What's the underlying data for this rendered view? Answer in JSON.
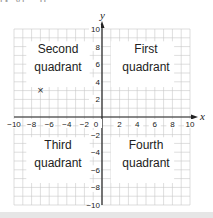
{
  "top_partial_text": "(x, y)   ...   p",
  "plane": {
    "xmin": -10,
    "xmax": 10,
    "ymin": -10,
    "ymax": 10,
    "axis_labels": {
      "x": "x",
      "y": "y"
    },
    "x_ticks": [
      "−10",
      "−8",
      "−6",
      "−4",
      "−2",
      "0",
      "2",
      "4",
      "6",
      "8",
      "10"
    ],
    "y_ticks": [
      "10",
      "8",
      "6",
      "4",
      "2",
      "−2",
      "−4",
      "−6",
      "−8",
      "−10"
    ],
    "quadrants": {
      "second": {
        "line1": "Second",
        "line2": "quadrant"
      },
      "first": {
        "line1": "First",
        "line2": "quadrant"
      },
      "third": {
        "line1": "Third",
        "line2": "quadrant"
      },
      "fourth": {
        "line1": "Fourth",
        "line2": "quadrant"
      }
    },
    "points": [
      {
        "x": -7,
        "y": 3,
        "marker": "×"
      }
    ],
    "colors": {
      "grid": "#c8c8c8",
      "axis": "#222222",
      "text": "#222222",
      "background": "#ffffff"
    }
  }
}
